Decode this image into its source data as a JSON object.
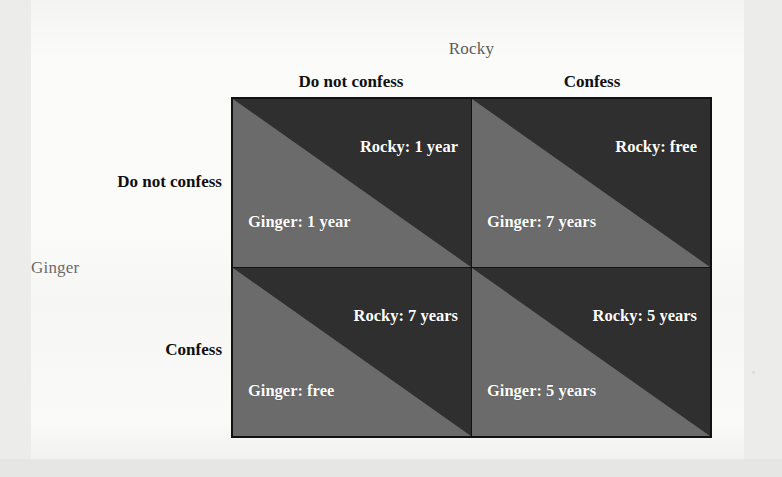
{
  "figure": {
    "type": "payoff-matrix",
    "column_player": "Rocky",
    "row_player": "Ginger",
    "column_headers": [
      "Do not confess",
      "Confess"
    ],
    "row_headers": [
      "Do not confess",
      "Confess"
    ],
    "colors": {
      "dark_triangle": "#2f2f2f",
      "light_triangle": "#6b6b6b",
      "border": "#111111",
      "payoff_text": "#fdfdfd",
      "page_background": "#fbfbfa"
    },
    "cells": [
      {
        "id": "cell-donotconfess-donotconfess",
        "row": "Do not confess",
        "column": "Do not confess",
        "column_player_payoff": "Rocky: 1 year",
        "row_player_payoff": "Ginger: 1 year"
      },
      {
        "id": "cell-donotconfess-confess",
        "row": "Do not confess",
        "column": "Confess",
        "column_player_payoff": "Rocky: free",
        "row_player_payoff": "Ginger: 7 years"
      },
      {
        "id": "cell-confess-donotconfess",
        "row": "Confess",
        "column": "Do not confess",
        "column_player_payoff": "Rocky: 7 years",
        "row_player_payoff": "Ginger: free"
      },
      {
        "id": "cell-confess-confess",
        "row": "Confess",
        "column": "Confess",
        "column_player_payoff": "Rocky: 5 years",
        "row_player_payoff": "Ginger: 5 years"
      }
    ]
  }
}
